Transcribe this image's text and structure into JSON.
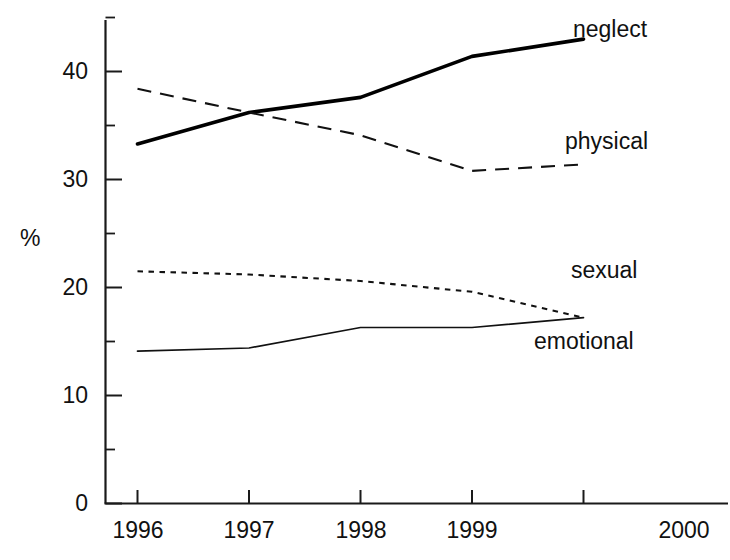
{
  "chart_data": {
    "type": "line",
    "title": "",
    "subtitle": "",
    "xlabel": "",
    "ylabel": "%",
    "categories": [
      "1996",
      "1997",
      "1998",
      "1999",
      "2000"
    ],
    "x": [
      1996,
      1997,
      1998,
      1999,
      2000
    ],
    "xlim": [
      1995.8,
      2000.15
    ],
    "ylim": [
      0,
      45
    ],
    "yticks": [
      0,
      10,
      20,
      30,
      40
    ],
    "yticklabels": [
      "0",
      "10",
      "20",
      "30",
      "40"
    ],
    "yminorticks": [
      5,
      15,
      25,
      35,
      45
    ],
    "grid": false,
    "legend_position": "inline-annotations",
    "series": [
      {
        "name": "neglect",
        "style": "solid-thick",
        "linewidth": 3.4,
        "color": "#000000",
        "values": [
          33.3,
          36.2,
          37.6,
          41.4,
          43.0
        ],
        "annotation": "neglect",
        "annotation_x": 573,
        "annotation_y": 16
      },
      {
        "name": "physical",
        "style": "dashed",
        "linewidth": 2.0,
        "dasharray": "13,8",
        "color": "#111111",
        "values": [
          38.4,
          36.2,
          34.1,
          30.8,
          31.4
        ],
        "annotation": "physical",
        "annotation_x": 565,
        "annotation_y": 128
      },
      {
        "name": "sexual",
        "style": "dotted",
        "linewidth": 2.0,
        "dasharray": "5,5",
        "color": "#111111",
        "values": [
          21.5,
          21.2,
          20.6,
          19.6,
          17.2
        ],
        "annotation": "sexual",
        "annotation_x": 571,
        "annotation_y": 257
      },
      {
        "name": "emotional",
        "style": "solid-thin",
        "linewidth": 1.6,
        "color": "#111111",
        "values": [
          14.1,
          14.4,
          16.3,
          16.3,
          17.2
        ],
        "annotation": "emotional",
        "annotation_x": 534,
        "annotation_y": 328
      }
    ]
  },
  "axes": {
    "y_title": "%",
    "y_tick_labels": [
      "40",
      "30",
      "20",
      "10",
      "0"
    ],
    "x_tick_labels": [
      "1996",
      "1997",
      "1998",
      "1999",
      "2000"
    ]
  }
}
